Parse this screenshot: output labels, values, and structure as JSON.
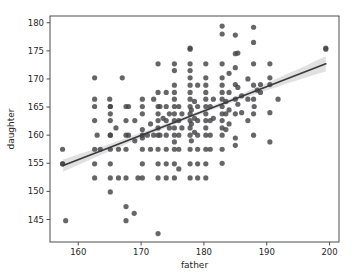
{
  "chart_data": {
    "type": "scatter",
    "title": "",
    "xlabel": "father",
    "ylabel": "daughter",
    "xlim": [
      155.5,
      201.5
    ],
    "ylim": [
      141.0,
      181.2
    ],
    "xticks": [
      160,
      170,
      180,
      190,
      200
    ],
    "yticks": [
      145,
      150,
      155,
      160,
      165,
      170,
      175,
      180
    ],
    "xtick_labels": [
      "160",
      "170",
      "180",
      "190",
      "200"
    ],
    "ytick_labels": [
      "145",
      "150",
      "155",
      "160",
      "165",
      "170",
      "175",
      "180"
    ],
    "grid": false,
    "legend": null,
    "marker_color": "#444448",
    "line_color": "#3a3a3e",
    "band_color": "#9a9a9e",
    "regression": {
      "visible": true,
      "x_start": 157.6,
      "y_start": 154.6,
      "x_end": 199.4,
      "y_end": 172.7,
      "slope": 0.433,
      "intercept": 86.3,
      "ci_halfwidth_start": 1.1,
      "ci_halfwidth_mid": 0.35,
      "ci_halfwidth_end": 1.35
    },
    "series": [
      {
        "name": "father vs daughter",
        "points": [
          [
            157.5,
            157.5
          ],
          [
            157.5,
            154.9
          ],
          [
            157.5,
            154.9
          ],
          [
            158.0,
            144.8
          ],
          [
            162.6,
            170.2
          ],
          [
            162.6,
            166.4
          ],
          [
            162.6,
            165.1
          ],
          [
            162.6,
            162.6
          ],
          [
            162.6,
            157.5
          ],
          [
            162.6,
            154.9
          ],
          [
            162.6,
            152.4
          ],
          [
            163.0,
            160.0
          ],
          [
            163.5,
            157.5
          ],
          [
            165.0,
            166.4
          ],
          [
            165.1,
            165.1
          ],
          [
            165.1,
            163.8
          ],
          [
            165.1,
            162.6
          ],
          [
            165.1,
            160.0
          ],
          [
            165.1,
            157.5
          ],
          [
            165.1,
            154.9
          ],
          [
            165.1,
            152.4
          ],
          [
            165.1,
            149.9
          ],
          [
            165.1,
            160.0
          ],
          [
            165.1,
            165.1
          ],
          [
            166.0,
            161.3
          ],
          [
            166.4,
            157.5
          ],
          [
            166.4,
            152.4
          ],
          [
            167.0,
            170.2
          ],
          [
            167.6,
            165.1
          ],
          [
            167.6,
            162.6
          ],
          [
            167.6,
            160.0
          ],
          [
            167.6,
            157.5
          ],
          [
            167.6,
            152.4
          ],
          [
            167.6,
            147.3
          ],
          [
            167.6,
            144.8
          ],
          [
            168.0,
            160.0
          ],
          [
            168.0,
            165.1
          ],
          [
            168.9,
            146.1
          ],
          [
            169.0,
            162.6
          ],
          [
            169.0,
            159.0
          ],
          [
            169.5,
            152.4
          ],
          [
            170.2,
            166.4
          ],
          [
            170.2,
            165.1
          ],
          [
            170.2,
            163.8
          ],
          [
            170.2,
            160.0
          ],
          [
            170.2,
            157.5
          ],
          [
            170.2,
            154.9
          ],
          [
            170.2,
            152.4
          ],
          [
            170.2,
            161.0
          ],
          [
            170.2,
            159.5
          ],
          [
            171.0,
            160.0
          ],
          [
            171.5,
            157.5
          ],
          [
            171.5,
            162.0
          ],
          [
            172.0,
            166.4
          ],
          [
            172.0,
            160.0
          ],
          [
            172.7,
            172.7
          ],
          [
            172.7,
            167.6
          ],
          [
            172.7,
            165.1
          ],
          [
            172.7,
            163.8
          ],
          [
            172.7,
            162.6
          ],
          [
            172.7,
            161.3
          ],
          [
            172.7,
            160.0
          ],
          [
            172.7,
            157.5
          ],
          [
            172.7,
            154.9
          ],
          [
            172.7,
            152.4
          ],
          [
            172.7,
            142.5
          ],
          [
            173.0,
            165.1
          ],
          [
            173.0,
            160.0
          ],
          [
            173.5,
            163.0
          ],
          [
            174.0,
            167.6
          ],
          [
            174.0,
            165.1
          ],
          [
            174.0,
            162.6
          ],
          [
            174.0,
            160.0
          ],
          [
            174.0,
            157.5
          ],
          [
            174.0,
            154.9
          ],
          [
            174.0,
            152.4
          ],
          [
            174.5,
            161.3
          ],
          [
            174.5,
            163.8
          ],
          [
            175.3,
            172.7
          ],
          [
            175.3,
            171.5
          ],
          [
            175.3,
            168.9
          ],
          [
            175.3,
            167.6
          ],
          [
            175.3,
            166.4
          ],
          [
            175.3,
            165.1
          ],
          [
            175.3,
            163.8
          ],
          [
            175.3,
            162.6
          ],
          [
            175.3,
            161.3
          ],
          [
            175.3,
            160.0
          ],
          [
            175.3,
            157.5
          ],
          [
            175.3,
            154.9
          ],
          [
            175.3,
            152.4
          ],
          [
            175.3,
            158.8
          ],
          [
            176.0,
            165.1
          ],
          [
            176.0,
            162.6
          ],
          [
            176.0,
            160.0
          ],
          [
            176.0,
            157.5
          ],
          [
            176.0,
            154.0
          ],
          [
            176.5,
            163.8
          ],
          [
            176.5,
            161.3
          ],
          [
            177.8,
            175.5
          ],
          [
            177.8,
            175.3
          ],
          [
            177.8,
            172.7
          ],
          [
            177.8,
            171.5
          ],
          [
            177.8,
            170.2
          ],
          [
            177.8,
            168.9
          ],
          [
            177.8,
            167.6
          ],
          [
            177.8,
            166.4
          ],
          [
            177.8,
            165.1
          ],
          [
            177.8,
            163.8
          ],
          [
            177.8,
            162.6
          ],
          [
            177.8,
            161.3
          ],
          [
            177.8,
            160.0
          ],
          [
            177.8,
            157.5
          ],
          [
            177.8,
            154.9
          ],
          [
            177.8,
            152.4
          ],
          [
            178.0,
            164.5
          ],
          [
            178.0,
            162.0
          ],
          [
            178.0,
            159.0
          ],
          [
            178.5,
            166.0
          ],
          [
            178.5,
            163.0
          ],
          [
            178.5,
            160.5
          ],
          [
            179.0,
            168.9
          ],
          [
            179.0,
            165.1
          ],
          [
            179.0,
            162.6
          ],
          [
            179.0,
            160.0
          ],
          [
            179.0,
            157.5
          ],
          [
            179.0,
            154.9
          ],
          [
            179.0,
            152.4
          ],
          [
            180.3,
            172.7
          ],
          [
            180.3,
            170.2
          ],
          [
            180.3,
            168.9
          ],
          [
            180.3,
            167.6
          ],
          [
            180.3,
            166.4
          ],
          [
            180.3,
            165.1
          ],
          [
            180.3,
            163.8
          ],
          [
            180.3,
            162.6
          ],
          [
            180.3,
            161.3
          ],
          [
            180.3,
            160.0
          ],
          [
            180.3,
            157.5
          ],
          [
            180.3,
            154.9
          ],
          [
            180.3,
            152.4
          ],
          [
            181.0,
            165.1
          ],
          [
            181.0,
            162.6
          ],
          [
            181.0,
            160.0
          ],
          [
            181.0,
            157.5
          ],
          [
            181.5,
            166.4
          ],
          [
            181.5,
            163.0
          ],
          [
            182.9,
            179.4
          ],
          [
            182.9,
            178.0
          ],
          [
            182.9,
            172.7
          ],
          [
            182.9,
            170.2
          ],
          [
            182.9,
            168.9
          ],
          [
            182.9,
            167.6
          ],
          [
            182.9,
            166.4
          ],
          [
            182.9,
            165.1
          ],
          [
            182.9,
            163.8
          ],
          [
            182.9,
            162.6
          ],
          [
            182.9,
            161.3
          ],
          [
            182.9,
            160.0
          ],
          [
            182.9,
            157.5
          ],
          [
            182.9,
            155.0
          ],
          [
            183.5,
            166.0
          ],
          [
            183.5,
            163.8
          ],
          [
            183.5,
            161.0
          ],
          [
            184.0,
            171.0
          ],
          [
            184.0,
            167.6
          ],
          [
            184.0,
            164.5
          ],
          [
            184.0,
            162.0
          ],
          [
            185.0,
            177.8
          ],
          [
            185.0,
            174.5
          ],
          [
            185.0,
            172.0
          ],
          [
            185.0,
            169.0
          ],
          [
            185.0,
            166.4
          ],
          [
            185.0,
            163.8
          ],
          [
            185.0,
            159.5
          ],
          [
            185.0,
            158.2
          ],
          [
            185.4,
            174.6
          ],
          [
            185.4,
            168.5
          ],
          [
            185.4,
            165.5
          ],
          [
            186.0,
            167.0
          ],
          [
            186.0,
            164.0
          ],
          [
            187.0,
            170.0
          ],
          [
            187.0,
            166.4
          ],
          [
            187.0,
            162.6
          ],
          [
            187.9,
            179.2
          ],
          [
            187.9,
            176.5
          ],
          [
            187.9,
            172.7
          ],
          [
            187.9,
            168.9
          ],
          [
            187.9,
            166.4
          ],
          [
            187.9,
            163.8
          ],
          [
            187.9,
            160.0
          ],
          [
            188.0,
            165.1
          ],
          [
            188.5,
            168.0
          ],
          [
            189.0,
            169.0
          ],
          [
            189.0,
            167.6
          ],
          [
            190.5,
            172.7
          ],
          [
            190.5,
            170.2
          ],
          [
            190.5,
            169.0
          ],
          [
            190.5,
            164.0
          ],
          [
            190.5,
            158.8
          ],
          [
            191.8,
            166.4
          ],
          [
            199.4,
            175.5
          ],
          [
            199.4,
            175.3
          ]
        ]
      }
    ],
    "n_points": 197
  },
  "axes": {
    "x_axis_name": "father-axis",
    "y_axis_name": "daughter-axis"
  }
}
